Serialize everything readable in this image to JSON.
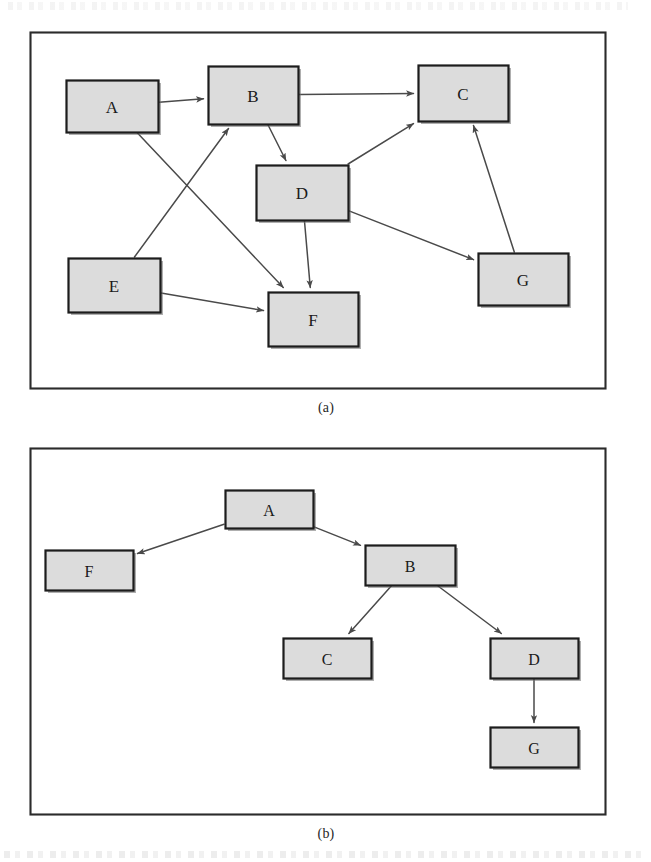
{
  "figure": {
    "panels": [
      {
        "id": "a",
        "caption": "(a)",
        "kind": "directed-graph",
        "frame": {
          "x": 30,
          "y": 32,
          "w": 575,
          "h": 356
        },
        "nodes": [
          {
            "id": "A",
            "label": "A",
            "x": 66,
            "y": 80,
            "w": 92,
            "h": 52
          },
          {
            "id": "B",
            "label": "B",
            "x": 208,
            "y": 66,
            "w": 90,
            "h": 58
          },
          {
            "id": "C",
            "label": "C",
            "x": 418,
            "y": 65,
            "w": 90,
            "h": 56
          },
          {
            "id": "D",
            "label": "D",
            "x": 256,
            "y": 165,
            "w": 92,
            "h": 55
          },
          {
            "id": "E",
            "label": "E",
            "x": 68,
            "y": 258,
            "w": 92,
            "h": 54
          },
          {
            "id": "F",
            "label": "F",
            "x": 268,
            "y": 292,
            "w": 90,
            "h": 54
          },
          {
            "id": "G",
            "label": "G",
            "x": 478,
            "y": 253,
            "w": 90,
            "h": 52
          }
        ],
        "edges": [
          {
            "from": "A",
            "to": "B"
          },
          {
            "from": "A",
            "to": "F"
          },
          {
            "from": "B",
            "to": "C"
          },
          {
            "from": "B",
            "to": "D"
          },
          {
            "from": "E",
            "to": "B"
          },
          {
            "from": "E",
            "to": "F"
          },
          {
            "from": "D",
            "to": "F"
          },
          {
            "from": "D",
            "to": "C"
          },
          {
            "from": "D",
            "to": "G"
          },
          {
            "from": "G",
            "to": "C"
          }
        ]
      },
      {
        "id": "b",
        "caption": "(b)",
        "kind": "tree",
        "frame": {
          "x": 30,
          "y": 448,
          "w": 575,
          "h": 366
        },
        "nodes": [
          {
            "id": "A",
            "label": "A",
            "x": 225,
            "y": 490,
            "w": 88,
            "h": 38
          },
          {
            "id": "F",
            "label": "F",
            "x": 45,
            "y": 550,
            "w": 88,
            "h": 40
          },
          {
            "id": "B",
            "label": "B",
            "x": 365,
            "y": 545,
            "w": 90,
            "h": 40
          },
          {
            "id": "C",
            "label": "C",
            "x": 283,
            "y": 638,
            "w": 88,
            "h": 40
          },
          {
            "id": "D",
            "label": "D",
            "x": 490,
            "y": 638,
            "w": 88,
            "h": 40
          },
          {
            "id": "G",
            "label": "G",
            "x": 490,
            "y": 727,
            "w": 88,
            "h": 40
          }
        ],
        "edges": [
          {
            "from": "A",
            "to": "F"
          },
          {
            "from": "A",
            "to": "B"
          },
          {
            "from": "B",
            "to": "C"
          },
          {
            "from": "B",
            "to": "D"
          },
          {
            "from": "D",
            "to": "G"
          }
        ]
      }
    ],
    "style": {
      "node_fill": "#dcdcdc",
      "node_stroke": "#1c1c1c",
      "edge_color": "#4a4a4a",
      "frame_color": "#2b2b2b",
      "label_color": "#1a1a1a",
      "page_background": "#ffffff"
    }
  }
}
